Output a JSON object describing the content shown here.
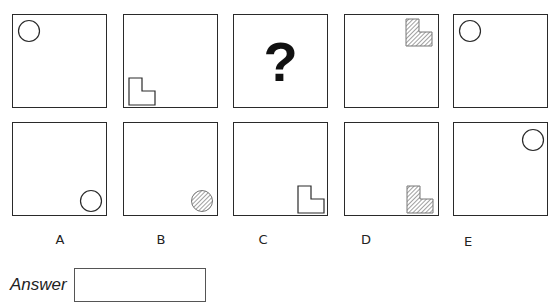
{
  "puzzle": {
    "top_row": [
      {
        "shape": "circle",
        "fill": "none",
        "position": "top-left"
      },
      {
        "shape": "l-shape",
        "fill": "none",
        "position": "bottom-left"
      },
      {
        "shape": "question-mark",
        "text": "?"
      },
      {
        "shape": "l-shape",
        "fill": "hatched",
        "position": "top-right"
      },
      {
        "shape": "circle",
        "fill": "none",
        "position": "top-left"
      }
    ],
    "options": [
      {
        "label": "A",
        "shape": "circle",
        "fill": "none",
        "position": "bottom-right"
      },
      {
        "label": "B",
        "shape": "circle",
        "fill": "hatched",
        "position": "bottom-right"
      },
      {
        "label": "C",
        "shape": "l-shape",
        "fill": "none",
        "position": "bottom-right"
      },
      {
        "label": "D",
        "shape": "l-shape",
        "fill": "hatched",
        "position": "bottom-right"
      },
      {
        "label": "E",
        "shape": "circle",
        "fill": "none",
        "position": "top-right"
      }
    ]
  },
  "answer": {
    "label": "Answer",
    "value": ""
  },
  "colors": {
    "stroke": "#2a2a2a",
    "hatch": "#777777"
  }
}
